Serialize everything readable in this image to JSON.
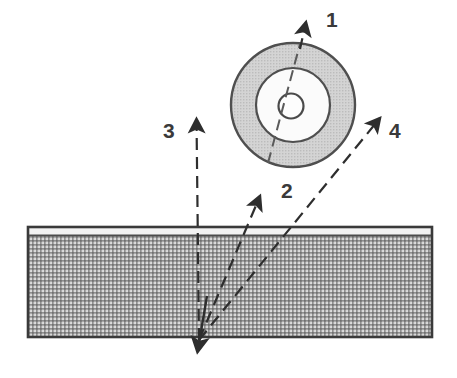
{
  "figure": {
    "background_color": "#ffffff",
    "width": 457,
    "height": 378
  },
  "colors": {
    "stroke": "#4a4a4a",
    "stroke_dark": "#2e2e2e",
    "disc_ring_fill": "#cdcdcd",
    "disc_inner_fill": "#fdfdfd",
    "net_mesh_dark": "#8c8c8c",
    "net_mesh_light": "#d2d2d2",
    "net_tape_fill": "#f4f4f4",
    "net_border": "#3a3a3a",
    "label_color": "#3a3a3a"
  },
  "disc": {
    "name": "wheel",
    "center_x": 293,
    "center_y": 105,
    "outer_radius": 63,
    "middle_radius": 37,
    "hub_radius": 13,
    "spoke_label": "radius-line"
  },
  "net": {
    "name": "net",
    "left": 27,
    "top": 226,
    "right": 433,
    "bottom": 338,
    "tape_height": 10,
    "mesh_pitch": 4
  },
  "vectors": [
    {
      "id": "vector-1",
      "label": "1",
      "label_x": 333,
      "label_y": 20,
      "from_x": 293,
      "from_y": 105,
      "to_x": 305,
      "to_y": 14,
      "style": "dashed",
      "description": "tangent to disc pointing up and slightly right"
    },
    {
      "id": "vector-2",
      "label": "2",
      "label_x": 288,
      "label_y": 191,
      "from_x": 199,
      "from_y": 340,
      "to_x": 261,
      "to_y": 188,
      "style": "dashed",
      "description": "up and to the right, steep"
    },
    {
      "id": "vector-3",
      "label": "3",
      "label_x": 171,
      "label_y": 131,
      "from_x": 199,
      "from_y": 340,
      "to_x": 196,
      "to_y": 110,
      "style": "dashed",
      "description": "straight up, vertical"
    },
    {
      "id": "vector-4",
      "label": "4",
      "label_x": 396,
      "label_y": 131,
      "from_x": 199,
      "from_y": 340,
      "to_x": 387,
      "to_y": 110,
      "style": "dashed",
      "description": "up and to the right, shallow"
    }
  ],
  "incoming": {
    "id": "incoming-trajectory",
    "from_x": 205,
    "from_y": 300,
    "to_x": 197,
    "to_y": 358,
    "style": "solid",
    "description": "arrow pointing down through the net"
  }
}
